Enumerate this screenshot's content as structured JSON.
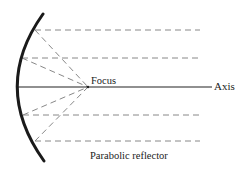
{
  "diagram": {
    "title": "Parabolic reflector",
    "labels": {
      "focus": "Focus",
      "axis": "Axis",
      "caption": "Parabolic reflector"
    },
    "colors": {
      "reflector": "#1a1a1a",
      "axis_line": "#222222",
      "rays": "#888888",
      "background": "#ffffff"
    },
    "reflector": {
      "top": [
        43,
        14
      ],
      "vertex": [
        17,
        87
      ],
      "bottom": [
        44,
        161
      ]
    },
    "focus_point": [
      88,
      87
    ],
    "axis_line": {
      "x1": 17,
      "x2": 212,
      "y": 87
    },
    "rays": [
      {
        "y": 30,
        "x_start": 35,
        "x_end": 200
      },
      {
        "y": 58,
        "x_start": 22,
        "x_end": 200
      },
      {
        "y": 115,
        "x_start": 23,
        "x_end": 200
      },
      {
        "y": 141,
        "x_start": 35,
        "x_end": 200
      }
    ]
  }
}
